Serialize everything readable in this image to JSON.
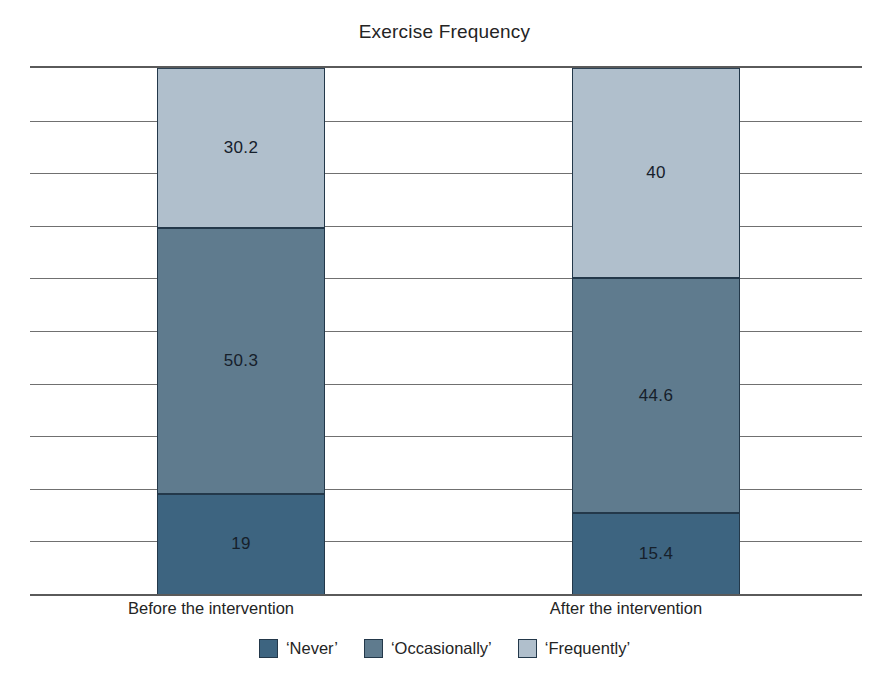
{
  "chart_data": {
    "type": "bar",
    "subtype": "stacked-bar-100-percent",
    "title": "Exercise Frequency",
    "xlabel": "",
    "ylabel": "",
    "ylim": [
      0,
      100
    ],
    "y_gridline_values": [
      0,
      10,
      20,
      30,
      40,
      50,
      60,
      70,
      80,
      90,
      100
    ],
    "y_tick_labels_visible": false,
    "grid": true,
    "legend_position": "bottom",
    "categories": [
      "Before the intervention",
      "After the intervention"
    ],
    "series": [
      {
        "name": "‘Never’",
        "color": "#3d6480",
        "values": [
          19,
          15.4
        ],
        "labels": [
          "19",
          "15.4"
        ]
      },
      {
        "name": "‘Occasionally’",
        "color": "#5f7b8e",
        "values": [
          50.3,
          44.6
        ],
        "labels": [
          "50.3",
          "44.6"
        ]
      },
      {
        "name": "‘Frequently’",
        "color": "#b0bfcc",
        "values": [
          30.2,
          40
        ],
        "labels": [
          "30.2",
          "40"
        ]
      }
    ],
    "stack_order_top_to_bottom": [
      "‘Frequently’",
      "‘Occasionally’",
      "‘Never’"
    ]
  },
  "colors": {
    "never": "#3d6480",
    "occasionally": "#5f7b8e",
    "frequently": "#b0bfcc",
    "axis": "#5a5a5a",
    "gridline": "#707070",
    "bar_outline": "#23384a",
    "text": "#242424",
    "background": "#ffffff"
  },
  "title": "Exercise Frequency",
  "categories": [
    {
      "label": "Before the intervention"
    },
    {
      "label": "After the intervention"
    }
  ],
  "bars": [
    {
      "name": "before",
      "segments": [
        {
          "series": "‘Frequently’",
          "value": 30.2,
          "label": "30.2"
        },
        {
          "series": "‘Occasionally’",
          "value": 50.3,
          "label": "50.3"
        },
        {
          "series": "‘Never’",
          "value": 19,
          "label": "19"
        }
      ]
    },
    {
      "name": "after",
      "segments": [
        {
          "series": "‘Frequently’",
          "value": 40,
          "label": "40"
        },
        {
          "series": "‘Occasionally’",
          "value": 44.6,
          "label": "44.6"
        },
        {
          "series": "‘Never’",
          "value": 15.4,
          "label": "15.4"
        }
      ]
    }
  ],
  "legend": {
    "items": [
      {
        "label": "‘Never’",
        "color": "#3d6480"
      },
      {
        "label": "‘Occasionally’",
        "color": "#5f7b8e"
      },
      {
        "label": "‘Frequently’",
        "color": "#b0bfcc"
      }
    ]
  }
}
